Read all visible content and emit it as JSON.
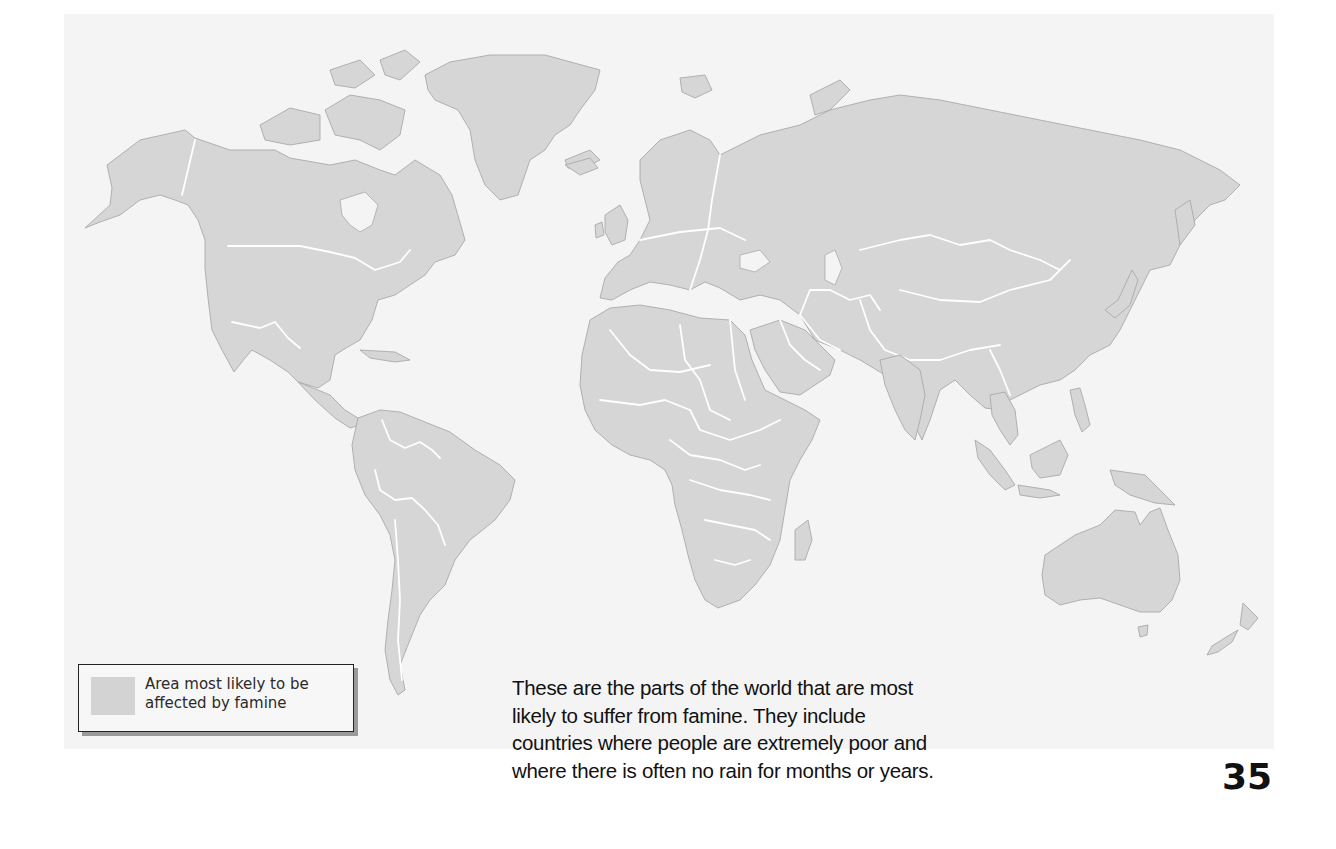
{
  "map": {
    "title": "",
    "description": "World map showing areas most likely to be affected by famine",
    "land_color": "#d6d6d6",
    "border_color": "#ffffff",
    "background_color": "#f4f4f4",
    "regions": [
      "North America",
      "Greenland",
      "South America",
      "Europe",
      "Africa",
      "Asia",
      "Australia",
      "New Zealand",
      "Indonesia"
    ]
  },
  "legend": {
    "swatch_color": "#d3d3d3",
    "label_line1": "Area most likely to be",
    "label_line2": "affected by famine"
  },
  "caption": {
    "lines": [
      "These are the parts of the world that are most",
      "likely to suffer from famine. They include",
      "countries where people are extremely poor and",
      "where there is often no rain for months or years."
    ]
  },
  "page": {
    "number": "35"
  }
}
